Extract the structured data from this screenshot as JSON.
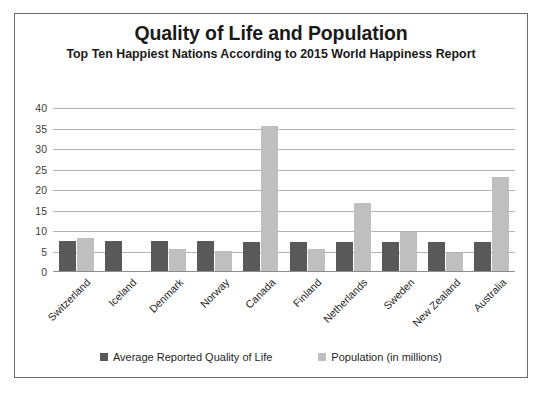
{
  "chart_data": {
    "type": "bar",
    "title": "Quality of Life and Population",
    "subtitle": "Top Ten Happiest Nations According to 2015 World Happiness Report",
    "xlabel": "",
    "ylabel": "",
    "ylim": [
      0,
      40
    ],
    "ytick_step": 5,
    "yticks": [
      40,
      35,
      30,
      25,
      20,
      15,
      10,
      5,
      0
    ],
    "grid": true,
    "legend_position": "bottom",
    "categories": [
      "Switzerland",
      "Iceland",
      "Denmark",
      "Norway",
      "Canada",
      "Finland",
      "Netherlands",
      "Sweden",
      "New Zealand",
      "Australia"
    ],
    "series": [
      {
        "name": "Average Reported Quality of Life",
        "color": "#595959",
        "values": [
          7.6,
          7.6,
          7.5,
          7.5,
          7.4,
          7.4,
          7.3,
          7.3,
          7.3,
          7.3
        ]
      },
      {
        "name": "Population (in millions)",
        "color": "#bfbfbf",
        "values": [
          8.3,
          0.3,
          5.7,
          5.2,
          35.5,
          5.5,
          16.9,
          9.8,
          4.6,
          23.1
        ]
      }
    ]
  },
  "axis": {
    "ytick_labels": [
      "40",
      "35",
      "30",
      "25",
      "20",
      "15",
      "10",
      "5",
      "0"
    ]
  },
  "legend": {
    "items": [
      {
        "label": "Average Reported Quality of Life",
        "color": "#595959"
      },
      {
        "label": "Population (in millions)",
        "color": "#bfbfbf"
      }
    ]
  }
}
